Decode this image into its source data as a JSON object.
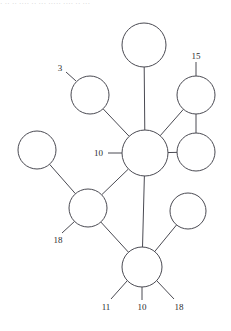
{
  "page": {
    "title_strip": "· ·· ·· ···· ·· ··· ····· ···· ·· ···"
  },
  "diagram": {
    "type": "node-link-graph",
    "stroke_color": "#4a4a52",
    "node_fill": "#ffffff",
    "label_color": "#2a2a2e",
    "nodes": [
      {
        "id": "n-top",
        "name": "node-top",
        "cx": 144,
        "cy": 45,
        "r": 22
      },
      {
        "id": "n-three",
        "name": "node-three",
        "cx": 90,
        "cy": 95,
        "r": 19
      },
      {
        "id": "n-fifteen",
        "name": "node-fifteen",
        "cx": 196,
        "cy": 95,
        "r": 19
      },
      {
        "id": "n-center",
        "name": "node-center-ten",
        "cx": 145,
        "cy": 153,
        "r": 23
      },
      {
        "id": "n-far-left",
        "name": "node-far-left",
        "cx": 37,
        "cy": 150,
        "r": 19
      },
      {
        "id": "n-right-mid",
        "name": "node-right-middle",
        "cx": 196,
        "cy": 152,
        "r": 19
      },
      {
        "id": "n-eighteen",
        "name": "node-eighteen",
        "cx": 88,
        "cy": 208,
        "r": 19
      },
      {
        "id": "n-lower-right",
        "name": "node-lower-right",
        "cx": 188,
        "cy": 211,
        "r": 18
      },
      {
        "id": "n-bottom",
        "name": "node-bottom",
        "cx": 142,
        "cy": 267,
        "r": 20
      }
    ],
    "edges": [
      {
        "name": "edge-top-to-center",
        "from": "n-top",
        "to": "n-center"
      },
      {
        "name": "edge-three-to-center",
        "from": "n-three",
        "to": "n-center"
      },
      {
        "name": "edge-center-to-right-mid",
        "from": "n-center",
        "to": "n-right-mid"
      },
      {
        "name": "edge-center-to-fifteen",
        "from": "n-center",
        "to": "n-fifteen"
      },
      {
        "name": "edge-fifteen-to-right-mid",
        "from": "n-fifteen",
        "to": "n-right-mid"
      },
      {
        "name": "edge-center-to-eighteen",
        "from": "n-center",
        "to": "n-eighteen"
      },
      {
        "name": "edge-center-to-bottom",
        "from": "n-center",
        "to": "n-bottom"
      },
      {
        "name": "edge-far-left-to-eighteen",
        "from": "n-far-left",
        "to": "n-eighteen"
      },
      {
        "name": "edge-eighteen-to-bottom",
        "from": "n-eighteen",
        "to": "n-bottom"
      },
      {
        "name": "edge-lower-right-to-bottom",
        "from": "n-lower-right",
        "to": "n-bottom"
      }
    ],
    "stub_edges": [
      {
        "name": "stub-label-three",
        "x1": 76,
        "y1": 81,
        "x2": 66,
        "y2": 72
      },
      {
        "name": "stub-label-fifteen",
        "x1": 196,
        "y1": 76,
        "x2": 196,
        "y2": 62
      },
      {
        "name": "stub-label-ten",
        "x1": 122,
        "y1": 153,
        "x2": 108,
        "y2": 153
      },
      {
        "name": "stub-label-eighteen",
        "x1": 75,
        "y1": 221,
        "x2": 62,
        "y2": 233
      },
      {
        "name": "stub-label-b11",
        "x1": 127,
        "y1": 281,
        "x2": 111,
        "y2": 299
      },
      {
        "name": "stub-label-b10",
        "x1": 142,
        "y1": 287,
        "x2": 142,
        "y2": 300
      },
      {
        "name": "stub-label-b18",
        "x1": 157,
        "y1": 281,
        "x2": 174,
        "y2": 299
      }
    ],
    "labels": [
      {
        "name": "label-three",
        "text": "3",
        "x": 60,
        "y": 71,
        "anchor": "middle"
      },
      {
        "name": "label-fifteen",
        "text": "15",
        "x": 196,
        "y": 59,
        "anchor": "middle"
      },
      {
        "name": "label-center-ten",
        "text": "10",
        "x": 103,
        "y": 156,
        "anchor": "end"
      },
      {
        "name": "label-eighteen",
        "text": "18",
        "x": 58,
        "y": 243,
        "anchor": "middle"
      },
      {
        "name": "label-bottom-eleven",
        "text": "11",
        "x": 106,
        "y": 310,
        "anchor": "middle"
      },
      {
        "name": "label-bottom-ten",
        "text": "10",
        "x": 142,
        "y": 310,
        "anchor": "middle"
      },
      {
        "name": "label-bottom-eighteen",
        "text": "18",
        "x": 179,
        "y": 310,
        "anchor": "middle"
      }
    ]
  }
}
